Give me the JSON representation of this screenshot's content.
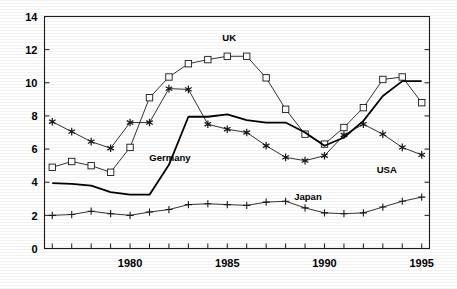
{
  "chart_data": {
    "type": "line",
    "title": "",
    "xlabel": "",
    "ylabel": "",
    "xlim": [
      1975.6,
      1995.4
    ],
    "ylim": [
      0,
      14
    ],
    "yticks": [
      0,
      2,
      4,
      6,
      8,
      10,
      12,
      14
    ],
    "ytick_labels": [
      "0",
      "2",
      "4",
      "6",
      "8",
      "10",
      "12",
      "14"
    ],
    "xticks": [
      1976,
      1977,
      1978,
      1979,
      1980,
      1981,
      1982,
      1983,
      1984,
      1985,
      1986,
      1987,
      1988,
      1989,
      1990,
      1991,
      1992,
      1993,
      1994,
      1995
    ],
    "xtick_labels_shown": [
      "1980",
      "1985",
      "1990",
      "1995"
    ],
    "xtick_label_values": [
      1980,
      1985,
      1990,
      1995
    ],
    "grid": false,
    "legend_position": "inline-annotations",
    "x": [
      1976,
      1977,
      1978,
      1979,
      1980,
      1981,
      1982,
      1983,
      1984,
      1985,
      1986,
      1987,
      1988,
      1989,
      1990,
      1991,
      1992,
      1993,
      1994,
      1995
    ],
    "series": [
      {
        "name": "UK",
        "marker": "square",
        "line_width": 0.8,
        "color": "#000000",
        "label_x": 1985.1,
        "label_y": 12.55,
        "values": [
          4.9,
          5.25,
          5.0,
          4.6,
          6.1,
          9.1,
          10.35,
          11.15,
          11.4,
          11.6,
          11.6,
          10.3,
          8.4,
          6.9,
          6.3,
          7.3,
          8.5,
          10.2,
          10.35,
          8.8
        ]
      },
      {
        "name": "USA",
        "marker": "asterisk",
        "line_width": 0.8,
        "color": "#000000",
        "label_x": 1993.2,
        "label_y": 4.55,
        "values": [
          7.65,
          7.05,
          6.45,
          6.05,
          7.6,
          7.6,
          9.65,
          9.6,
          7.5,
          7.2,
          7.0,
          6.2,
          5.5,
          5.3,
          5.6,
          6.85,
          7.5,
          6.9,
          6.1,
          5.65
        ]
      },
      {
        "name": "Germany",
        "marker": "none",
        "line_width": 1.8,
        "color": "#000000",
        "label_x": 1982.05,
        "label_y": 5.3,
        "values": [
          3.95,
          3.9,
          3.8,
          3.4,
          3.25,
          3.25,
          5.05,
          7.95,
          7.95,
          8.1,
          7.75,
          7.6,
          7.6,
          7.0,
          6.2,
          6.7,
          7.7,
          9.2,
          10.1,
          10.1
        ]
      },
      {
        "name": "Japan",
        "marker": "plus",
        "line_width": 0.8,
        "color": "#000000",
        "label_x": 1989.15,
        "label_y": 2.92,
        "values": [
          2.0,
          2.05,
          2.25,
          2.1,
          2.0,
          2.2,
          2.35,
          2.65,
          2.7,
          2.65,
          2.6,
          2.8,
          2.85,
          2.45,
          2.15,
          2.1,
          2.15,
          2.5,
          2.85,
          3.1
        ]
      }
    ]
  }
}
